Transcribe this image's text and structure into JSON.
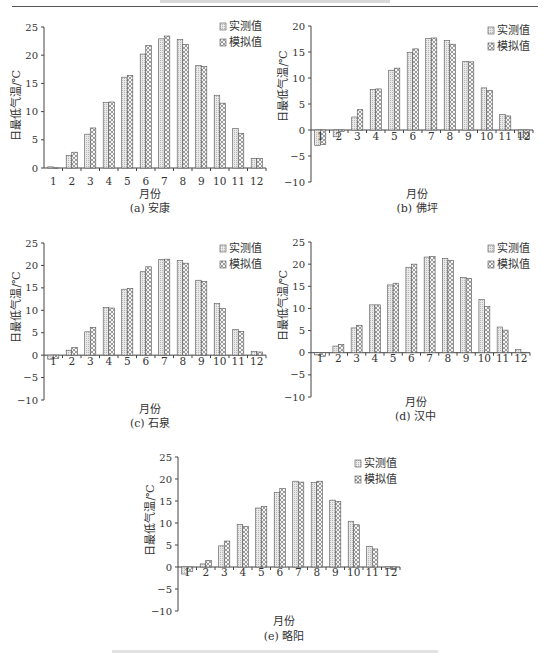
{
  "page": {
    "header_text_visible": false,
    "figure_caption_visible": false
  },
  "legend": {
    "observed": "实测值",
    "simulated": "模拟值"
  },
  "colors": {
    "observed_fill": "#e9e9e9",
    "simulated_fill": "#f4f4f4",
    "bar_stroke": "#555555",
    "axis": "#444444"
  },
  "chart_data": [
    {
      "id": "a",
      "type": "bar",
      "title": "(a) 安康",
      "xlabel": "月份",
      "ylabel": "日最低气温/℃",
      "categories": [
        "1",
        "2",
        "3",
        "4",
        "5",
        "6",
        "7",
        "8",
        "9",
        "10",
        "11",
        "12"
      ],
      "ylim": [
        0,
        25
      ],
      "yticks": [
        0,
        5,
        10,
        15,
        20,
        25
      ],
      "grid": false,
      "legend_position": "top-right",
      "series": [
        {
          "name": "实测值",
          "values": [
            0.2,
            2.2,
            6.0,
            11.6,
            16.1,
            20.2,
            22.9,
            22.8,
            18.2,
            12.9,
            7.0,
            1.7
          ]
        },
        {
          "name": "模拟值",
          "values": [
            0.0,
            2.8,
            7.1,
            11.7,
            16.4,
            21.7,
            23.4,
            21.9,
            18.0,
            11.5,
            6.1,
            1.7
          ]
        }
      ]
    },
    {
      "id": "b",
      "type": "bar",
      "title": "(b) 佛坪",
      "xlabel": "月份",
      "ylabel": "日最低气温/℃",
      "categories": [
        "1",
        "2",
        "3",
        "4",
        "5",
        "6",
        "7",
        "8",
        "9",
        "10",
        "11",
        "12"
      ],
      "ylim": [
        -10,
        20
      ],
      "yticks": [
        -10,
        -5,
        0,
        5,
        10,
        15,
        20
      ],
      "grid": false,
      "legend_position": "top-right",
      "series": [
        {
          "name": "实测值",
          "values": [
            -3.0,
            -1.3,
            2.5,
            7.8,
            11.5,
            14.9,
            17.6,
            17.2,
            13.2,
            8.1,
            3.0,
            -1.5
          ]
        },
        {
          "name": "模拟值",
          "values": [
            -2.8,
            -0.3,
            3.9,
            7.9,
            11.9,
            15.6,
            17.7,
            16.5,
            13.1,
            7.6,
            2.7,
            -1.6
          ]
        }
      ]
    },
    {
      "id": "c",
      "type": "bar",
      "title": "(c) 石泉",
      "xlabel": "月份",
      "ylabel": "日最低气温/℃",
      "categories": [
        "1",
        "2",
        "3",
        "4",
        "5",
        "6",
        "7",
        "8",
        "9",
        "10",
        "11",
        "12"
      ],
      "ylim": [
        -10,
        25
      ],
      "yticks": [
        -10,
        -5,
        0,
        5,
        10,
        15,
        20,
        25
      ],
      "grid": false,
      "legend_position": "top-right",
      "series": [
        {
          "name": "实测值",
          "values": [
            -0.9,
            1.1,
            5.2,
            10.6,
            14.7,
            18.6,
            21.3,
            21.1,
            16.7,
            11.5,
            5.7,
            0.8
          ]
        },
        {
          "name": "模拟值",
          "values": [
            -0.7,
            1.7,
            6.2,
            10.5,
            14.9,
            19.7,
            21.4,
            20.5,
            16.4,
            10.4,
            5.3,
            0.7
          ]
        }
      ]
    },
    {
      "id": "d",
      "type": "bar",
      "title": "(d) 汉中",
      "xlabel": "月份",
      "ylabel": "日最低气温/℃",
      "categories": [
        "1",
        "2",
        "3",
        "4",
        "5",
        "6",
        "7",
        "8",
        "9",
        "10",
        "11",
        "12"
      ],
      "ylim": [
        -10,
        25
      ],
      "yticks": [
        -10,
        -5,
        0,
        5,
        10,
        15,
        20,
        25
      ],
      "grid": false,
      "legend_position": "top-right",
      "series": [
        {
          "name": "实测值",
          "values": [
            -0.5,
            1.5,
            5.6,
            10.8,
            15.3,
            19.3,
            21.6,
            21.3,
            17.0,
            12.0,
            5.8,
            0.7
          ]
        },
        {
          "name": "模拟值",
          "values": [
            -0.8,
            1.9,
            6.2,
            10.8,
            15.7,
            20.0,
            21.7,
            20.8,
            16.8,
            10.4,
            5.1,
            0.1
          ]
        }
      ]
    },
    {
      "id": "e",
      "type": "bar",
      "title": "(e) 略阳",
      "xlabel": "月份",
      "ylabel": "日最低气温/℃",
      "categories": [
        "1",
        "2",
        "3",
        "4",
        "5",
        "6",
        "7",
        "8",
        "9",
        "10",
        "11",
        "12"
      ],
      "ylim": [
        -10,
        25
      ],
      "yticks": [
        -10,
        -5,
        0,
        5,
        10,
        15,
        20,
        25
      ],
      "grid": false,
      "legend_position": "top-right",
      "series": [
        {
          "name": "实测值",
          "values": [
            -1.6,
            0.7,
            4.8,
            9.7,
            13.4,
            16.9,
            19.5,
            19.2,
            15.2,
            10.4,
            4.7,
            -0.3
          ]
        },
        {
          "name": "模拟值",
          "values": [
            -1.0,
            1.5,
            5.9,
            9.2,
            13.8,
            17.8,
            19.3,
            19.5,
            14.9,
            9.6,
            4.1,
            -0.6
          ]
        }
      ]
    }
  ]
}
